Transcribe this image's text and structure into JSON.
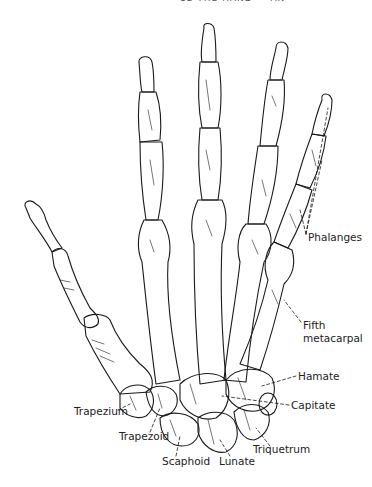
{
  "header": {
    "text": "12 THE HAND — AN"
  },
  "figure": {
    "labels": [
      {
        "id": "phalanges",
        "text": "Phalanges",
        "x": 308,
        "y": 231
      },
      {
        "id": "fifth-metacarpal",
        "text": "Fifth",
        "x": 303,
        "y": 319
      },
      {
        "id": "fifth-metacarpal-2",
        "text": "metacarpal",
        "x": 303,
        "y": 332
      },
      {
        "id": "hamate",
        "text": "Hamate",
        "x": 298,
        "y": 372
      },
      {
        "id": "capitate",
        "text": "Capitate",
        "x": 291,
        "y": 401
      },
      {
        "id": "trapezium",
        "text": "Trapezium",
        "x": 74,
        "y": 406
      },
      {
        "id": "trapezoid",
        "text": "Trapezoid",
        "x": 119,
        "y": 431
      },
      {
        "id": "scaphoid",
        "text": "Scaphoid",
        "x": 162,
        "y": 455
      },
      {
        "id": "lunate",
        "text": "Lunate",
        "x": 219,
        "y": 455
      },
      {
        "id": "triquetrum",
        "text": "Triquetrum",
        "x": 253,
        "y": 444
      }
    ]
  },
  "colors": {
    "ink": "#1a1a1a",
    "background": "#ffffff"
  }
}
